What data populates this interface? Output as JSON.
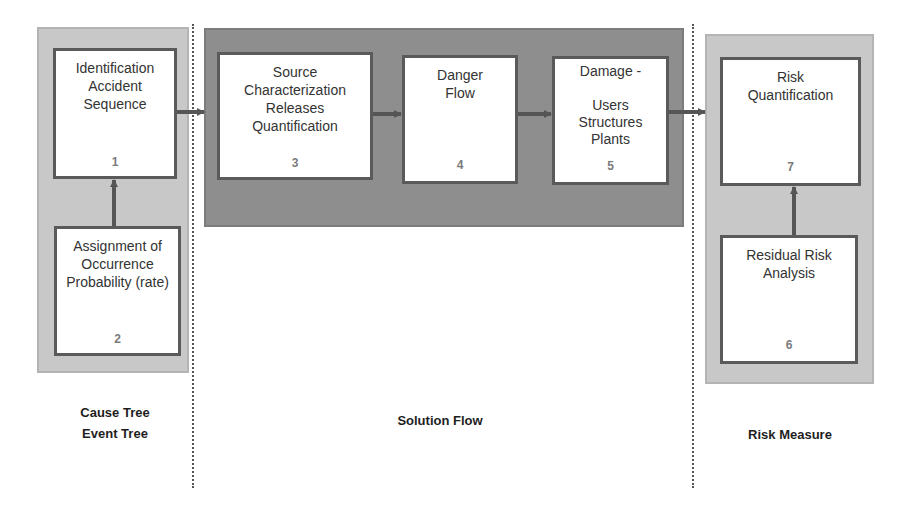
{
  "colors": {
    "panel_light": "#c8c8c8",
    "panel_dark": "#8e8e8e",
    "box_border": "#5a5a5a",
    "arrow": "#555555"
  },
  "boxes": [
    {
      "id": "1",
      "label": "Identification\nAccident\nSequence",
      "number": "1"
    },
    {
      "id": "2",
      "label": "Assignment of\nOccurrence\nProbability (rate)",
      "number": "2"
    },
    {
      "id": "3",
      "label": "Source\nCharacterization\nReleases\nQuantification",
      "number": "3"
    },
    {
      "id": "4",
      "label": "Danger\nFlow",
      "number": "4"
    },
    {
      "id": "5",
      "label": "Damage -\n\nUsers\nStructures\nPlants",
      "number": "5"
    },
    {
      "id": "6",
      "label": "Residual Risk\nAnalysis",
      "number": "6"
    },
    {
      "id": "7",
      "label": "Risk\nQuantification",
      "number": "7"
    }
  ],
  "sections": [
    {
      "name": "cause-event-tree",
      "caption": "Cause Tree\nEvent Tree"
    },
    {
      "name": "solution-flow",
      "caption": "Solution Flow"
    },
    {
      "name": "risk-measure",
      "caption": "Risk Measure"
    }
  ],
  "connections": [
    {
      "from": "2",
      "to": "1"
    },
    {
      "from": "1",
      "to": "3"
    },
    {
      "from": "3",
      "to": "4"
    },
    {
      "from": "4",
      "to": "5"
    },
    {
      "from": "5",
      "to": "7"
    },
    {
      "from": "6",
      "to": "7"
    }
  ]
}
